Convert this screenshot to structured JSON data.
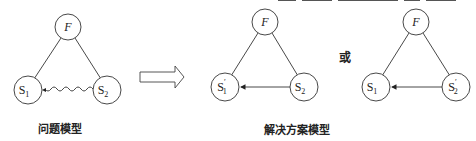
{
  "diagram": {
    "problem_model": {
      "caption": "问题模型",
      "nodes": [
        {
          "id": "F",
          "label": "F",
          "italic": true
        },
        {
          "id": "S1",
          "label": "S",
          "sub": "1"
        },
        {
          "id": "S2",
          "label": "S",
          "sub": "2"
        }
      ],
      "edges": [
        {
          "from": "F",
          "to": "S1",
          "style": "solid"
        },
        {
          "from": "F",
          "to": "S2",
          "style": "solid"
        },
        {
          "from": "S2",
          "to": "S1",
          "style": "wavy-arrow",
          "meaning": "harmful action"
        }
      ]
    },
    "transition_arrow": "hollow-right-arrow",
    "or_label": "或",
    "solution_model": {
      "caption": "解决方案模型",
      "variants": [
        {
          "nodes": [
            {
              "id": "F",
              "label": "F",
              "italic": true
            },
            {
              "id": "S1'",
              "label": "S",
              "sub": "1",
              "prime": "′"
            },
            {
              "id": "S2",
              "label": "S",
              "sub": "2"
            }
          ],
          "edges": [
            {
              "from": "F",
              "to": "S1'",
              "style": "solid"
            },
            {
              "from": "F",
              "to": "S2",
              "style": "solid"
            },
            {
              "from": "S2",
              "to": "S1'",
              "style": "solid-arrow"
            }
          ]
        },
        {
          "nodes": [
            {
              "id": "F",
              "label": "F",
              "italic": true
            },
            {
              "id": "S1",
              "label": "S",
              "sub": "1"
            },
            {
              "id": "S2'",
              "label": "S",
              "sub": "2",
              "prime": "′"
            }
          ],
          "edges": [
            {
              "from": "F",
              "to": "S1",
              "style": "solid"
            },
            {
              "from": "F",
              "to": "S2'",
              "style": "solid"
            },
            {
              "from": "S2'",
              "to": "S1",
              "style": "solid-arrow"
            }
          ]
        }
      ]
    }
  },
  "labels": {
    "F": "F",
    "S": "S",
    "sub1": "1",
    "sub2": "2",
    "prime": "′"
  }
}
